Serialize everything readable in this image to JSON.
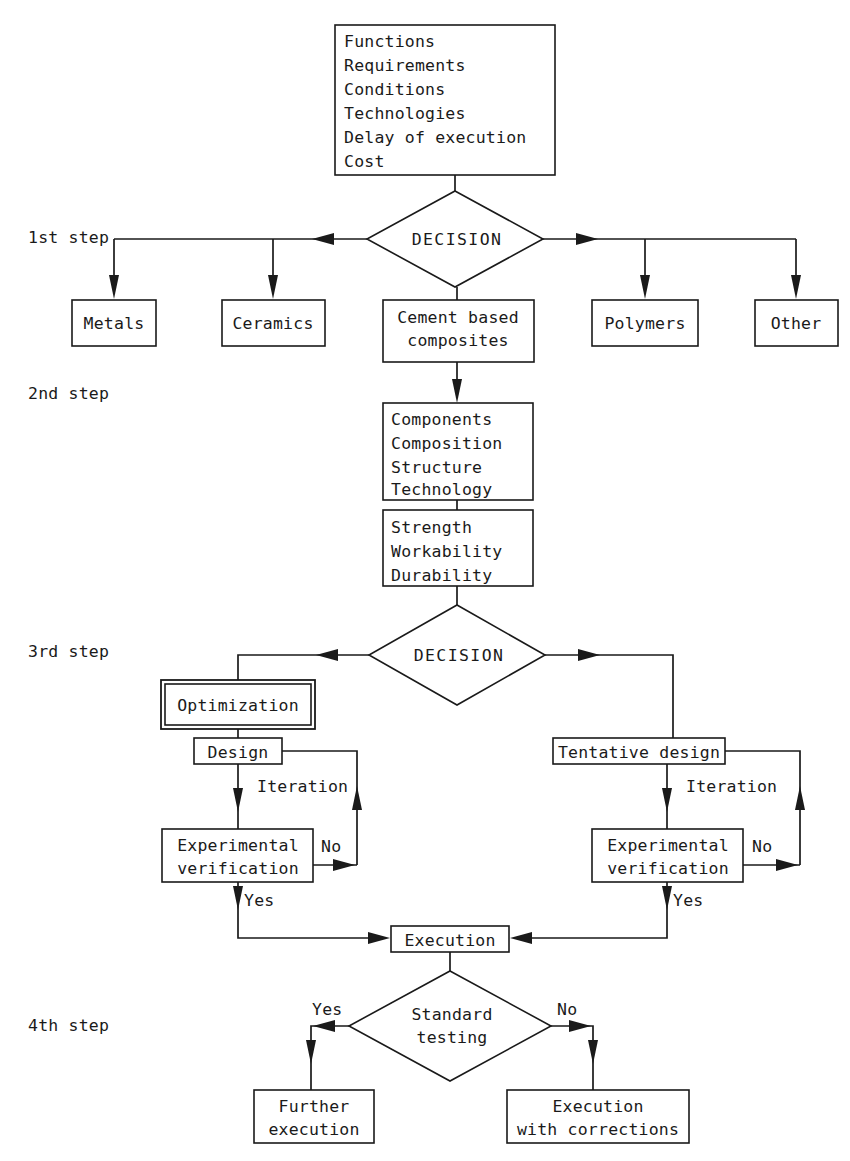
{
  "diagram": {
    "step_labels": [
      {
        "id": "step1",
        "text": "1st step"
      },
      {
        "id": "step2",
        "text": "2nd step"
      },
      {
        "id": "step3",
        "text": "3rd step"
      },
      {
        "id": "step4",
        "text": "4th step"
      }
    ],
    "nodes": {
      "requirements": {
        "type": "box",
        "lines": [
          "Functions",
          "Requirements",
          "Conditions",
          "Technologies",
          "Delay of execution",
          "Cost"
        ]
      },
      "decision1": {
        "type": "diamond",
        "label": "DECISION"
      },
      "metals": {
        "type": "box",
        "lines": [
          "Metals"
        ]
      },
      "ceramics": {
        "type": "box",
        "lines": [
          "Ceramics"
        ]
      },
      "cement_composites": {
        "type": "box",
        "lines": [
          "Cement based",
          "composites"
        ]
      },
      "polymers": {
        "type": "box",
        "lines": [
          "Polymers"
        ]
      },
      "other": {
        "type": "box",
        "lines": [
          "Other"
        ]
      },
      "composition": {
        "type": "box",
        "lines": [
          "Components",
          "Composition",
          "Structure",
          "Technology"
        ]
      },
      "properties": {
        "type": "box",
        "lines": [
          "Strength",
          "Workability",
          "Durability"
        ]
      },
      "decision2": {
        "type": "diamond",
        "label": "DECISION"
      },
      "optimization": {
        "type": "box-double",
        "lines": [
          "Optimization"
        ]
      },
      "design": {
        "type": "box",
        "lines": [
          "Design"
        ]
      },
      "experimental_verification_left": {
        "type": "box",
        "lines": [
          "Experimental",
          "verification"
        ]
      },
      "tentative_design": {
        "type": "box",
        "lines": [
          "Tentative design"
        ]
      },
      "experimental_verification_right": {
        "type": "box",
        "lines": [
          "Experimental",
          "verification"
        ]
      },
      "execution": {
        "type": "box",
        "lines": [
          "Execution"
        ]
      },
      "standard_testing": {
        "type": "diamond",
        "lines": [
          "Standard",
          "testing"
        ]
      },
      "further_execution": {
        "type": "box",
        "lines": [
          "Further",
          "execution"
        ]
      },
      "execution_with_corrections": {
        "type": "box",
        "lines": [
          "Execution",
          "with corrections"
        ]
      }
    },
    "edge_labels": [
      {
        "id": "iteration-left",
        "text": "Iteration"
      },
      {
        "id": "no-left",
        "text": "No"
      },
      {
        "id": "yes-left",
        "text": "Yes"
      },
      {
        "id": "iteration-right",
        "text": "Iteration"
      },
      {
        "id": "no-right",
        "text": "No"
      },
      {
        "id": "yes-right",
        "text": "Yes"
      },
      {
        "id": "testing-yes",
        "text": "Yes"
      },
      {
        "id": "testing-no",
        "text": "No"
      }
    ],
    "colors": {
      "ink": "#1a1a1a",
      "paper": "#ffffff"
    }
  }
}
